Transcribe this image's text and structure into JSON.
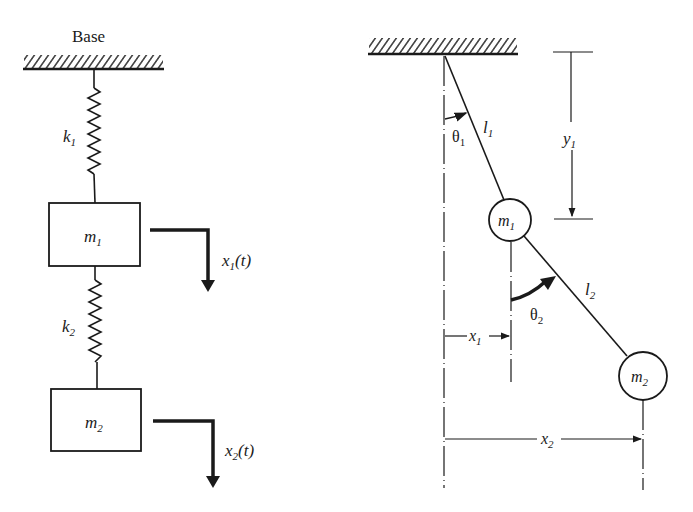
{
  "colors": {
    "ink": "#1a1a1a",
    "background": "#ffffff"
  },
  "left_diagram": {
    "title": "Spring-mass system",
    "base_label": "Base",
    "spring1": {
      "symbol": "k",
      "subscript": "1"
    },
    "spring2": {
      "symbol": "k",
      "subscript": "2"
    },
    "mass1": {
      "symbol": "m",
      "subscript": "1"
    },
    "mass2": {
      "symbol": "m",
      "subscript": "2"
    },
    "disp1": {
      "symbol": "x",
      "subscript": "1",
      "arg": "(t)"
    },
    "disp2": {
      "symbol": "x",
      "subscript": "2",
      "arg": "(t)"
    }
  },
  "right_diagram": {
    "title": "Double pendulum",
    "theta1": {
      "symbol": "θ",
      "subscript": "1"
    },
    "theta2": {
      "symbol": "θ",
      "subscript": "2"
    },
    "length1": {
      "symbol": "l",
      "subscript": "1"
    },
    "length2": {
      "symbol": "l",
      "subscript": "2"
    },
    "mass1": {
      "symbol": "m",
      "subscript": "1"
    },
    "mass2": {
      "symbol": "m",
      "subscript": "2"
    },
    "dim_y1": {
      "symbol": "y",
      "subscript": "1"
    },
    "dim_x1": {
      "symbol": "x",
      "subscript": "1"
    },
    "dim_x2": {
      "symbol": "x",
      "subscript": "2"
    }
  }
}
